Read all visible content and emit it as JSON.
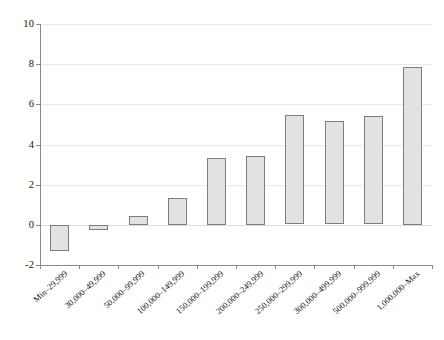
{
  "chart_data": {
    "type": "bar",
    "title": "",
    "subtitle": "",
    "xlabel": "",
    "ylabel": "",
    "categories": [
      "Min–29,999",
      "30,000–49,999",
      "50,000–99,999",
      "100,000–149,999",
      "150,000–199,999",
      "200,000–249,999",
      "250,000–299,999",
      "300,000–499,999",
      "500,000–999,999",
      "1,000,000–Max"
    ],
    "values": [
      -1.3,
      -0.25,
      0.45,
      1.35,
      3.35,
      3.45,
      5.45,
      5.15,
      5.4,
      7.85
    ],
    "ylim": [
      -2,
      10
    ],
    "ytick_values": [
      -2,
      0,
      2,
      4,
      6,
      8,
      10
    ],
    "ytick_labels": [
      "-2",
      "0",
      "2",
      "4",
      "6",
      "8",
      "10"
    ],
    "grid": true,
    "legend": false,
    "legend_position": "none",
    "series": [
      {
        "name": "",
        "values": [
          -1.3,
          -0.25,
          0.45,
          1.35,
          3.35,
          3.45,
          5.45,
          5.15,
          5.4,
          7.85
        ]
      }
    ],
    "colors": {
      "bar_fill": "#e2e2e2",
      "bar_border": "#7d7d7d",
      "gridline": "#e9e9e9",
      "axis": "#8a8a8a",
      "text": "#141414",
      "background": "#ffffff"
    }
  }
}
